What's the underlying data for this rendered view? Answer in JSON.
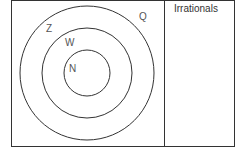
{
  "diagram": {
    "type": "nested-venn",
    "sets": {
      "rationals": "Q",
      "integers": "Z",
      "whole": "W",
      "natural": "N"
    },
    "irrationals_label": "Irrationals",
    "line_color": "#333333",
    "text_color": "#555555"
  }
}
